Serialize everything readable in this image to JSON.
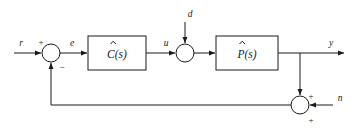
{
  "diagram": {
    "type": "control-block-diagram",
    "background_color": "#ffffff",
    "line_color": "#1a1a1a",
    "blocks": [
      {
        "id": "controller",
        "label": "C(s)",
        "label_base": "C",
        "label_suffix": "(s)",
        "accent_mark": "hat",
        "x": 88,
        "y": 36,
        "width": 58,
        "height": 34
      },
      {
        "id": "plant",
        "label": "P(s)",
        "label_base": "P",
        "label_suffix": "(s)",
        "accent_mark": "hat",
        "x": 216,
        "y": 36,
        "width": 62,
        "height": 34
      }
    ],
    "summing_junctions": [
      {
        "id": "error-junction",
        "cx": 51,
        "cy": 53,
        "r": 9,
        "signs": [
          {
            "symbol": "+",
            "position": "top-left",
            "x": 41,
            "y": 42
          },
          {
            "symbol": "−",
            "position": "bottom-right",
            "x": 60,
            "y": 68
          }
        ]
      },
      {
        "id": "disturbance-junction",
        "cx": 185,
        "cy": 53,
        "r": 9,
        "signs": []
      },
      {
        "id": "noise-junction",
        "cx": 300,
        "cy": 105,
        "r": 9,
        "signs": [
          {
            "symbol": "+",
            "position": "top-right",
            "x": 311,
            "y": 96
          },
          {
            "symbol": "+",
            "position": "bottom-right",
            "x": 311,
            "y": 122
          }
        ]
      }
    ],
    "signals": [
      {
        "id": "reference",
        "label": "r",
        "x": 21,
        "y": 46
      },
      {
        "id": "error",
        "label": "e",
        "x": 72,
        "y": 46
      },
      {
        "id": "control",
        "label": "u",
        "x": 166,
        "y": 46
      },
      {
        "id": "disturbance",
        "label": "d",
        "x": 188,
        "y": 16
      },
      {
        "id": "output",
        "label": "y",
        "x": 330,
        "y": 46
      },
      {
        "id": "noise",
        "label": "n",
        "x": 337,
        "y": 100
      }
    ]
  }
}
